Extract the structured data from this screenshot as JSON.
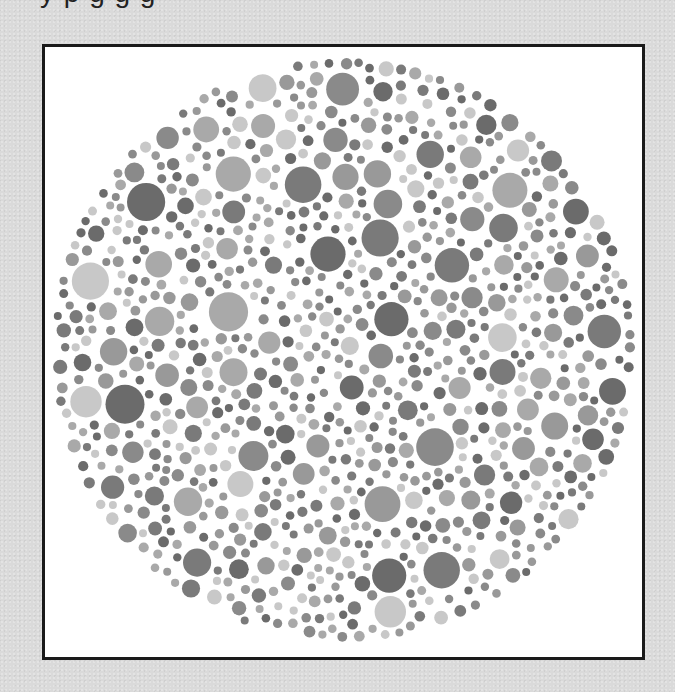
{
  "page": {
    "clipped_heading_fragment": "y     p  g       g g",
    "background_color": "#dadada"
  },
  "plate": {
    "type": "ishihara-style color vision test plate (grayscale)",
    "frame": {
      "x": 42,
      "y": 44,
      "width": 603,
      "height": 616,
      "border_color": "#1a1a1a",
      "fill": "#ffffff"
    },
    "circle": {
      "cx": 343,
      "cy": 350,
      "r": 292
    },
    "dot_shades": [
      "#6b6b6b",
      "#8a8a8a",
      "#a9a9a9",
      "#c8c8c8",
      "#7a7a7a",
      "#999999"
    ],
    "dot_radius_range": [
      4,
      20
    ],
    "seed": 20240917,
    "dot_count_target": 900
  }
}
